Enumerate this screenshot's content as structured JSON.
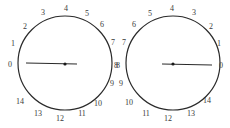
{
  "dials": [
    {
      "id": "left-dial",
      "direction": "clockwise",
      "center": [
        65,
        63
      ],
      "radius": 47,
      "hand_reading": 0,
      "labels": [
        {
          "text": "0",
          "x": 10,
          "y": 67
        },
        {
          "text": "1",
          "x": 13,
          "y": 46
        },
        {
          "text": "2",
          "x": 25,
          "y": 29
        },
        {
          "text": "3",
          "x": 43,
          "y": 15
        },
        {
          "text": "4",
          "x": 66,
          "y": 11
        },
        {
          "text": "5",
          "x": 87,
          "y": 16
        },
        {
          "text": "6",
          "x": 102,
          "y": 27
        },
        {
          "text": "7",
          "x": 113,
          "y": 45
        },
        {
          "text": "8",
          "x": 116,
          "y": 68
        },
        {
          "text": "9",
          "x": 112,
          "y": 86
        },
        {
          "text": "10",
          "x": 98,
          "y": 106
        },
        {
          "text": "11",
          "x": 82,
          "y": 116
        },
        {
          "text": "12",
          "x": 60,
          "y": 121
        },
        {
          "text": "13",
          "x": 38,
          "y": 116
        },
        {
          "text": "14",
          "x": 20,
          "y": 104
        }
      ]
    },
    {
      "id": "right-dial",
      "direction": "counterclockwise",
      "center": [
        173,
        63
      ],
      "radius": 47,
      "hand_reading": 0,
      "labels": [
        {
          "text": "0",
          "x": 221,
          "y": 68
        },
        {
          "text": "1",
          "x": 219,
          "y": 46
        },
        {
          "text": "2",
          "x": 211,
          "y": 29
        },
        {
          "text": "3",
          "x": 194,
          "y": 15
        },
        {
          "text": "4",
          "x": 172,
          "y": 11
        },
        {
          "text": "5",
          "x": 150,
          "y": 16
        },
        {
          "text": "6",
          "x": 134,
          "y": 27
        },
        {
          "text": "7",
          "x": 124,
          "y": 45
        },
        {
          "text": "8",
          "x": 118,
          "y": 68
        },
        {
          "text": "9",
          "x": 121,
          "y": 86
        },
        {
          "text": "10",
          "x": 129,
          "y": 105
        },
        {
          "text": "11",
          "x": 146,
          "y": 116
        },
        {
          "text": "12",
          "x": 168,
          "y": 121
        },
        {
          "text": "13",
          "x": 191,
          "y": 116
        },
        {
          "text": "14",
          "x": 207,
          "y": 103
        }
      ]
    }
  ],
  "colors": {
    "stroke": "#2a2a2a",
    "label": "#3a3a3a",
    "background": "#ffffff"
  }
}
